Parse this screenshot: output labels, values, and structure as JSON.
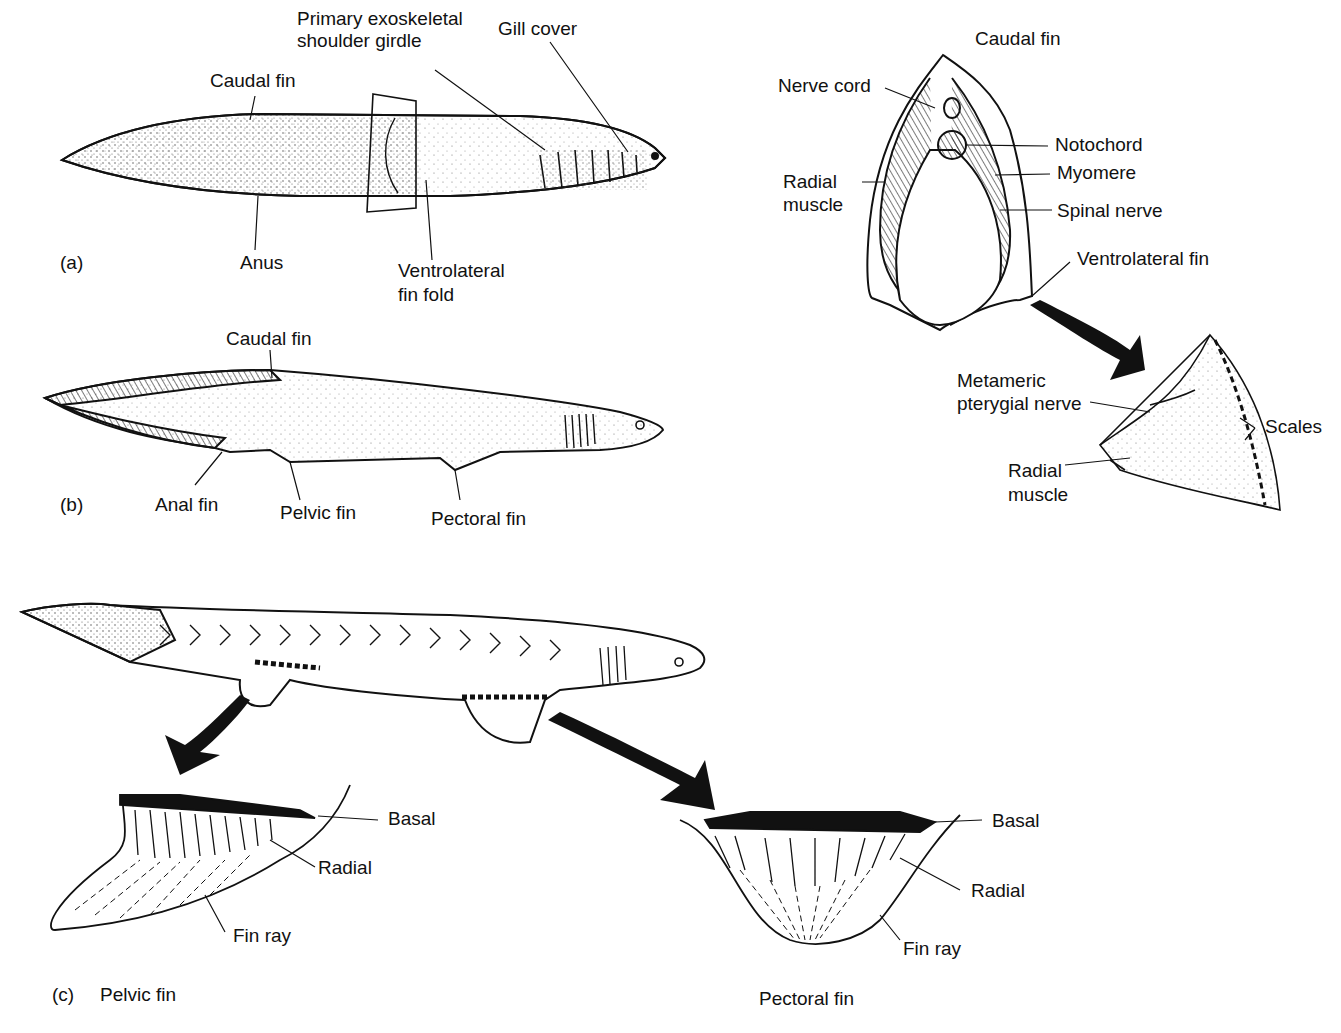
{
  "figure": {
    "panel_a": {
      "tag": "(a)",
      "labels": {
        "caudal_fin": "Caudal fin",
        "primary_line1": "Primary exoskeletal",
        "primary_line2": "shoulder girdle",
        "gill_cover": "Gill cover",
        "anus": "Anus",
        "ventrolateral_line1": "Ventrolateral",
        "ventrolateral_line2": "fin fold"
      }
    },
    "cross_section": {
      "labels": {
        "caudal_fin": "Caudal fin",
        "nerve_cord": "Nerve cord",
        "notochord": "Notochord",
        "myomere": "Myomere",
        "radial_muscle_line1": "Radial",
        "radial_muscle_line2": "muscle",
        "spinal_nerve": "Spinal nerve",
        "ventrolateral_fin": "Ventrolateral fin"
      }
    },
    "fin_detail": {
      "labels": {
        "metameric_line1": "Metameric",
        "metameric_line2": "pterygial nerve",
        "scales": "Scales",
        "radial_muscle_line1": "Radial",
        "radial_muscle_line2": "muscle"
      }
    },
    "panel_b": {
      "tag": "(b)",
      "labels": {
        "caudal_fin": "Caudal fin",
        "anal_fin": "Anal fin",
        "pelvic_fin": "Pelvic fin",
        "pectoral_fin": "Pectoral fin"
      }
    },
    "panel_c": {
      "tag": "(c)",
      "pelvic": {
        "title": "Pelvic fin",
        "basal": "Basal",
        "radial": "Radial",
        "fin_ray": "Fin ray"
      },
      "pectoral": {
        "title": "Pectoral fin",
        "basal": "Basal",
        "radial": "Radial",
        "fin_ray": "Fin ray"
      }
    }
  }
}
